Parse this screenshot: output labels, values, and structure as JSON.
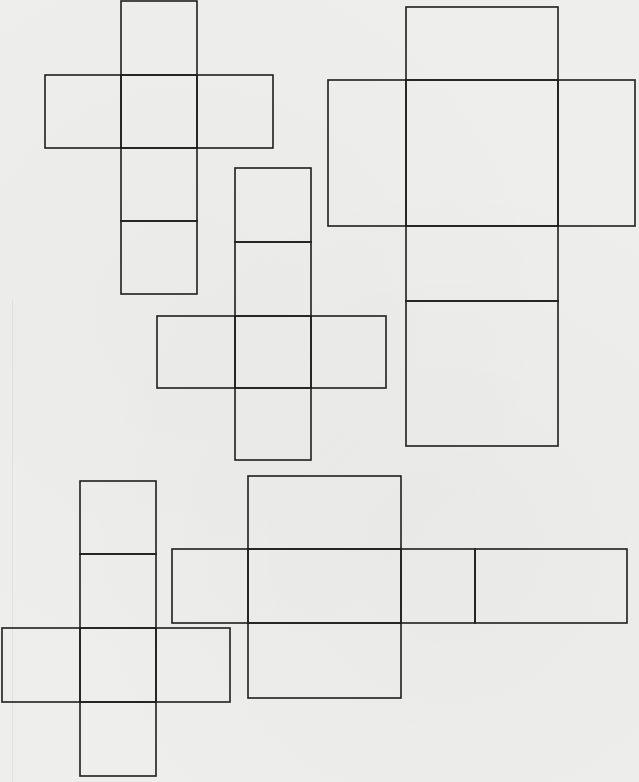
{
  "page": {
    "type": "worksheet"
  },
  "nets": [
    {
      "id": "net-1",
      "face_count": 6,
      "layout": "cross-long-column",
      "faces": [
        [
          1,
          0
        ],
        [
          0,
          1
        ],
        [
          1,
          1
        ],
        [
          2,
          1
        ],
        [
          1,
          2
        ],
        [
          1,
          3
        ]
      ]
    },
    {
      "id": "net-2",
      "face_count": 6,
      "layout": "cross-long-column",
      "faces": [
        [
          1,
          0
        ],
        [
          0,
          1
        ],
        [
          1,
          1
        ],
        [
          2,
          1
        ],
        [
          1,
          2
        ],
        [
          1,
          3
        ]
      ]
    },
    {
      "id": "net-3",
      "face_count": 6,
      "layout": "cross-long-column",
      "faces": [
        [
          1,
          0
        ],
        [
          1,
          1
        ],
        [
          0,
          2
        ],
        [
          1,
          2
        ],
        [
          2,
          2
        ],
        [
          1,
          3
        ]
      ]
    },
    {
      "id": "net-4",
      "face_count": 6,
      "layout": "cross-long-column",
      "faces": [
        [
          1,
          0
        ],
        [
          1,
          1
        ],
        [
          0,
          2
        ],
        [
          1,
          2
        ],
        [
          2,
          2
        ],
        [
          1,
          3
        ]
      ]
    },
    {
      "id": "net-5",
      "face_count": 6,
      "layout": "cross-long-row",
      "faces": [
        [
          1,
          0
        ],
        [
          0,
          1
        ],
        [
          1,
          1
        ],
        [
          2,
          1
        ],
        [
          3,
          1
        ],
        [
          1,
          2
        ]
      ]
    }
  ]
}
